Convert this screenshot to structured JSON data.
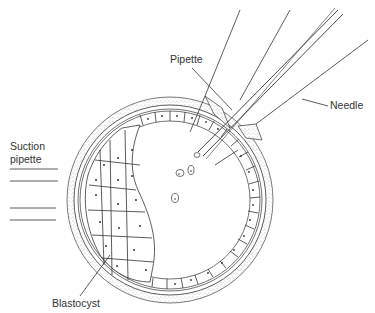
{
  "diagram": {
    "type": "biological illustration",
    "labels": {
      "pipette": "Pipette",
      "needle": "Needle",
      "suction_pipette_line1": "Suction",
      "suction_pipette_line2": "pipette",
      "blastocyst": "Blastocyst"
    },
    "colors": {
      "ink": "#333333",
      "background": "#ffffff",
      "stipple": "#777777"
    }
  }
}
